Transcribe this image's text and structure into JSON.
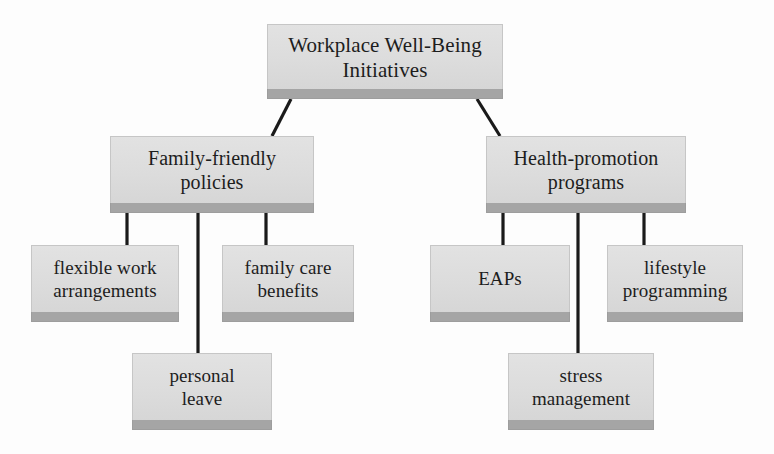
{
  "diagram": {
    "type": "hierarchy-tree",
    "title_node": "Workplace Well-Being Initiatives",
    "nodes": {
      "root": {
        "label": "Workplace Well-Being\nInitiatives",
        "x": 267,
        "y": 24,
        "w": 236,
        "h": 66
      },
      "branch_left": {
        "label": "Family-friendly\npolicies",
        "x": 110,
        "y": 136,
        "w": 204,
        "h": 68
      },
      "branch_right": {
        "label": "Health-promotion\nprograms",
        "x": 486,
        "y": 136,
        "w": 200,
        "h": 68
      },
      "leaf_flexible_work": {
        "label": "flexible work\narrangements",
        "x": 31,
        "y": 245,
        "w": 148,
        "h": 68
      },
      "leaf_family_care": {
        "label": "family care\nbenefits",
        "x": 222,
        "y": 245,
        "w": 132,
        "h": 68
      },
      "leaf_personal_leave": {
        "label": "personal\nleave",
        "x": 132,
        "y": 353,
        "w": 140,
        "h": 68
      },
      "leaf_eaps": {
        "label": "EAPs",
        "x": 430,
        "y": 245,
        "w": 140,
        "h": 68
      },
      "leaf_lifestyle": {
        "label": "lifestyle\nprogramming",
        "x": 607,
        "y": 245,
        "w": 136,
        "h": 68
      },
      "leaf_stress": {
        "label": "stress\nmanagement",
        "x": 508,
        "y": 353,
        "w": 146,
        "h": 68
      }
    },
    "edges": [
      {
        "name": "root-to-family-friendly",
        "from": "root",
        "to": "branch_left",
        "path": "M 291 99 L 272 136"
      },
      {
        "name": "root-to-health-promotion",
        "from": "root",
        "to": "branch_right",
        "path": "M 477 99 L 500 136"
      },
      {
        "name": "family-friendly-to-flexible-work",
        "from": "branch_left",
        "to": "leaf_flexible_work",
        "path": "M 127 213 L 127 245"
      },
      {
        "name": "family-friendly-to-personal-leave",
        "from": "branch_left",
        "to": "leaf_personal_leave",
        "path": "M 198 213 L 198 353"
      },
      {
        "name": "family-friendly-to-family-care",
        "from": "branch_left",
        "to": "leaf_family_care",
        "path": "M 266 213 L 266 245"
      },
      {
        "name": "health-promotion-to-eaps",
        "from": "branch_right",
        "to": "leaf_eaps",
        "path": "M 503 213 L 503 245"
      },
      {
        "name": "health-promotion-to-stress-management",
        "from": "branch_right",
        "to": "leaf_stress",
        "path": "M 578 213 L 578 353"
      },
      {
        "name": "health-promotion-to-lifestyle",
        "from": "branch_right",
        "to": "leaf_lifestyle",
        "path": "M 644 213 L 644 245"
      }
    ],
    "colors": {
      "node_fill": "#dcdcdc",
      "node_shadow": "#a5a5a5",
      "connector": "#1a1a1a",
      "text": "#1d1d1d",
      "background": "#fdfdfd"
    }
  }
}
